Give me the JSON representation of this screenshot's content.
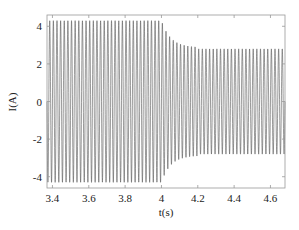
{
  "chart_data": {
    "type": "line",
    "title": "",
    "xlabel": "t(s)",
    "ylabel": "I(A)",
    "xlim": [
      3.37,
      4.68
    ],
    "ylim": [
      -4.6,
      4.6
    ],
    "xticks": [
      "3.4",
      "3.6",
      "3.8",
      "4",
      "4.2",
      "4.4",
      "4.6"
    ],
    "yticks": [
      "-4",
      "-2",
      "0",
      "2",
      "4"
    ],
    "grid": false,
    "legend": null,
    "series": [
      {
        "name": "I",
        "description": "Sinusoidal current ~50 Hz; amplitude ~4.3 A until t=4 s, then decays to ~2.8 A steady state",
        "frequency_hz": 50,
        "segments": [
          {
            "t_start": 3.37,
            "t_end": 4.0,
            "amplitude": 4.3
          },
          {
            "t_start": 4.0,
            "t_end": 4.2,
            "amplitude_start": 4.3,
            "amplitude_end": 2.9
          },
          {
            "t_start": 4.2,
            "t_end": 4.68,
            "amplitude": 2.8
          }
        ]
      }
    ],
    "line_color": "#555555"
  }
}
